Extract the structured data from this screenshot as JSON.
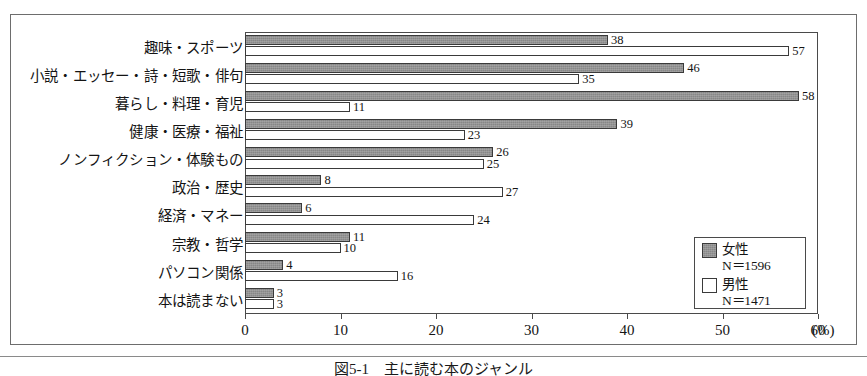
{
  "figure": {
    "caption": "図5-1　主に読む本のジャンル",
    "x_unit_label": "(%)"
  },
  "legend": {
    "entries": [
      {
        "key": "female",
        "label": "女性",
        "n_label": "N＝1596",
        "swatch": "filled-gray-swatch"
      },
      {
        "key": "male",
        "label": "男性",
        "n_label": "N＝1471",
        "swatch": "empty-white-swatch"
      }
    ]
  },
  "axis": {
    "ticks": [
      {
        "value": 0,
        "label": "0"
      },
      {
        "value": 10,
        "label": "10"
      },
      {
        "value": 20,
        "label": "20"
      },
      {
        "value": 30,
        "label": "30"
      },
      {
        "value": 40,
        "label": "40"
      },
      {
        "value": 50,
        "label": "50"
      },
      {
        "value": 60,
        "label": "60"
      }
    ]
  },
  "chart_data": {
    "type": "bar",
    "orientation": "horizontal",
    "title": "図5-1　主に読む本のジャンル",
    "xlabel": "(%)",
    "ylabel": "",
    "xlim": [
      0,
      60
    ],
    "grid": false,
    "legend_position": "inside-lower-right",
    "categories": [
      "趣味・スポーツ",
      "小説・エッセー・詩・短歌・俳句",
      "暮らし・料理・育児",
      "健康・医療・福祉",
      "ノンフィクション・体験もの",
      "政治・歴史",
      "経済・マネー",
      "宗教・哲学",
      "パソコン関係",
      "本は読まない"
    ],
    "series": [
      {
        "name": "女性",
        "n": 1596,
        "color": "#878787",
        "values": [
          38,
          46,
          58,
          39,
          26,
          8,
          6,
          11,
          4,
          3
        ]
      },
      {
        "name": "男性",
        "n": 1471,
        "color": "#ffffff",
        "values": [
          57,
          35,
          11,
          23,
          25,
          27,
          24,
          10,
          16,
          3
        ]
      }
    ]
  }
}
